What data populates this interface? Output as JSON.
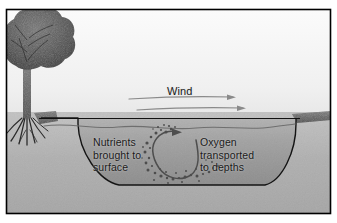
{
  "figure": {
    "title_text_visible": false,
    "frame": {
      "border_color": "#000000",
      "background": "#ffffff"
    },
    "labels": {
      "wind": "Wind",
      "nutrients": "Nutrients\nbrought to\nsurface",
      "oxygen": "Oxygen\ntransported\nto depths"
    },
    "scene": {
      "sky_color": "#f2f2f2",
      "ground_color": "#b3b3b3",
      "water_color": "#a0a0a0",
      "water_deep_color": "#8c8c8c",
      "tree_canopy_color": "#4f4f4f",
      "tree_trunk_color": "#3b3b3b",
      "bank_cap_color": "#6b6b6b",
      "outline_color": "#111111",
      "arrow_color": "#6a6a6a",
      "circulation_arrow_color": "#4a4a4a",
      "bubble_color": "#5a5a5a"
    },
    "elements": {
      "tree": "deciduous-tree-with-roots",
      "wind_arrows": 2,
      "circulation_loop": "counterclockwise-vertical-mixing-loop",
      "bubble_plume": "rising-bubble-column"
    }
  }
}
